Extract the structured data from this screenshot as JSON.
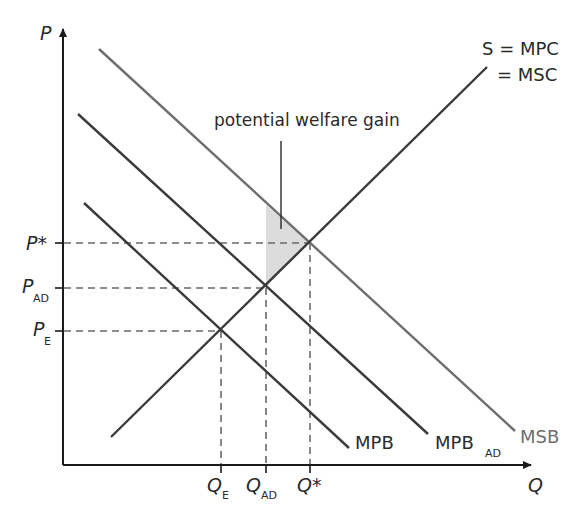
{
  "diagram": {
    "axes": {
      "y_label": "P",
      "x_label": "Q"
    },
    "price_labels": {
      "p_star": {
        "main": "P*",
        "sub": ""
      },
      "p_ad": {
        "main": "P",
        "sub": "AD"
      },
      "p_e": {
        "main": "P",
        "sub": "E"
      }
    },
    "quantity_labels": {
      "q_e": {
        "main": "Q",
        "sub": "E"
      },
      "q_ad": {
        "main": "Q",
        "sub": "AD"
      },
      "q_star": {
        "main": "Q*",
        "sub": ""
      }
    },
    "curves": {
      "supply_line1": "S = MPC",
      "supply_line2": "= MSC",
      "mpb": "MPB",
      "mpb_ad_main": "MPB",
      "mpb_ad_sub": "AD",
      "msb": "MSB"
    },
    "annotation": "potential welfare gain",
    "colors": {
      "axis": "#1a1a1a",
      "curve_dark": "#3a3a3a",
      "curve_msb": "#6e6e6e",
      "dashed": "#6a6a6a",
      "shade": "#dcdcdc",
      "text": "#2a2a2a",
      "text_msb": "#6e6e6e"
    }
  }
}
